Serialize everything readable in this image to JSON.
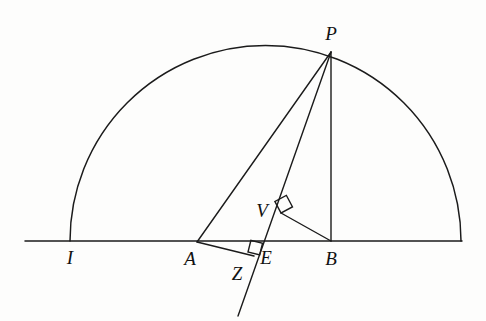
{
  "figure": {
    "kind": "euclidean-geometry-diagram",
    "background_color": "#fdfdfc",
    "ink_color": "#1b1b1b",
    "canvas": {
      "width": 486,
      "height": 321
    }
  },
  "baseline": {
    "name": "horizontal-base-line",
    "x1": 25,
    "y1": 241,
    "x2": 462,
    "y2": 241
  },
  "semicircle": {
    "name": "semicircle-arc",
    "center_x": 265.5,
    "center_y": 241,
    "radius": 195.5,
    "start_x": 70,
    "end_x": 461
  },
  "points": [
    {
      "id": "P",
      "label": "P",
      "x": 331,
      "y": 52,
      "label_x": 331,
      "label_y": 40,
      "desc": "point-p-on-arc"
    },
    {
      "id": "V",
      "label": "V",
      "x": 281,
      "y": 213,
      "label_x": 262,
      "label_y": 217,
      "desc": "point-v-foot-of-perpendicular"
    },
    {
      "id": "I",
      "label": "I",
      "x": 70,
      "y": 241,
      "label_x": 70,
      "label_y": 264,
      "desc": "point-i-left-end-of-diameter"
    },
    {
      "id": "A",
      "label": "A",
      "x": 197,
      "y": 242,
      "label_x": 190,
      "label_y": 265,
      "desc": "point-a-on-baseline"
    },
    {
      "id": "Z",
      "label": "Z",
      "x": 248,
      "y": 255,
      "label_x": 237,
      "label_y": 280,
      "desc": "point-z-below-baseline"
    },
    {
      "id": "E",
      "label": "E",
      "x": 256,
      "y": 241,
      "label_x": 266,
      "label_y": 264,
      "desc": "point-e-intersection-on-baseline"
    },
    {
      "id": "B",
      "label": "B",
      "x": 331,
      "y": 241,
      "label_x": 331,
      "label_y": 265,
      "desc": "point-b-foot-of-altitude"
    }
  ],
  "segments": [
    {
      "id": "PA",
      "name": "segment-p-a",
      "x1": 331,
      "y1": 52,
      "x2": 197,
      "y2": 242
    },
    {
      "id": "PB",
      "name": "segment-p-b",
      "x1": 331,
      "y1": 52,
      "x2": 331,
      "y2": 241
    },
    {
      "id": "PZ",
      "name": "line-p-through-v-to-z-extended",
      "x1": 331,
      "y1": 52,
      "x2": 238,
      "y2": 316
    },
    {
      "id": "AZ",
      "name": "segment-a-to-z",
      "x1": 197,
      "y1": 242,
      "x2": 254,
      "y2": 256
    },
    {
      "id": "VB",
      "name": "segment-v-b",
      "x1": 281,
      "y1": 213,
      "x2": 331,
      "y2": 241
    }
  ],
  "right_angles": [
    {
      "id": "angle-at-V",
      "name": "right-angle-mark-v",
      "vertex_x": 281,
      "vertex_y": 213,
      "size": 13,
      "desc": "PZ perpendicular to VB"
    },
    {
      "id": "angle-at-Z",
      "name": "right-angle-mark-z",
      "vertex_x": 248,
      "vertex_y": 252,
      "size": 12,
      "desc": "AZ perpendicular to PZ"
    }
  ]
}
